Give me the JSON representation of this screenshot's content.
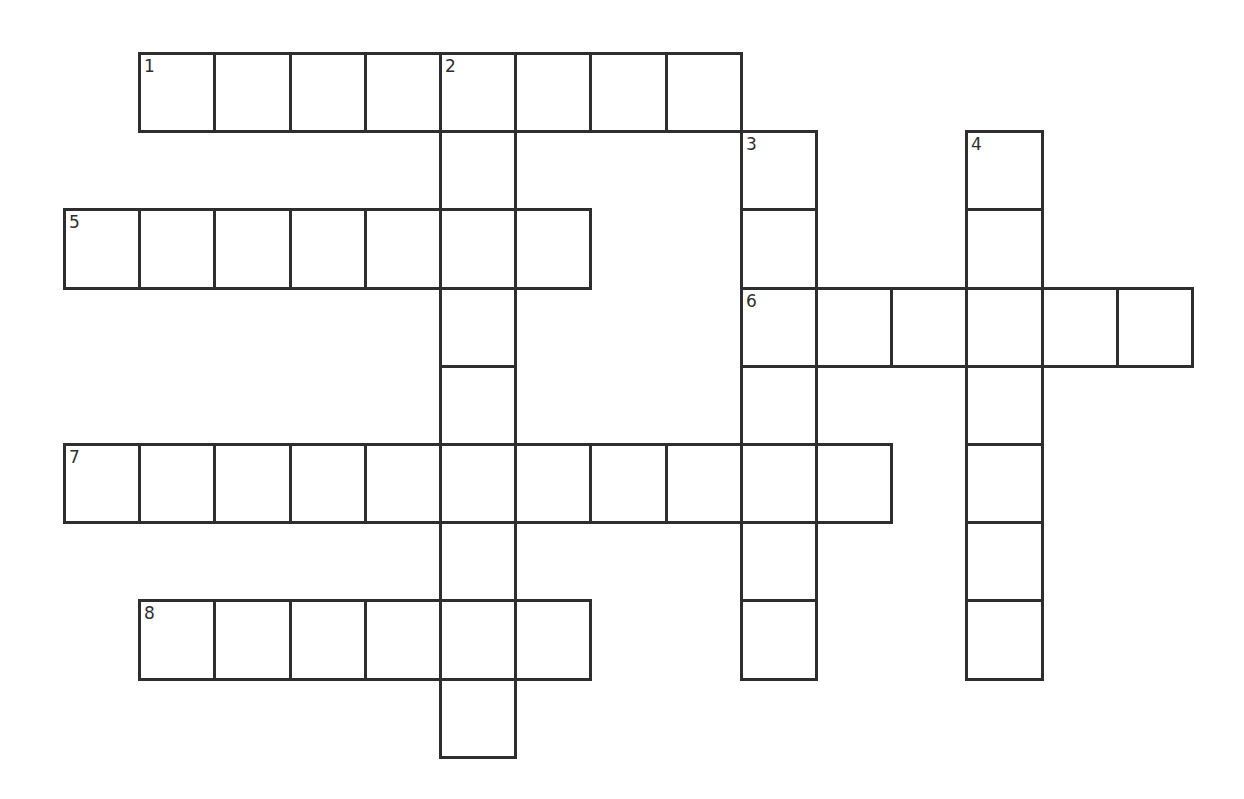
{
  "puzzle": {
    "type": "crossword",
    "grid_origin": {
      "x": 63,
      "y": 52
    },
    "cell_width": 75.2,
    "cell_height": 78.2,
    "line_color": "#2e2e2e",
    "entries": [
      {
        "number": "1",
        "direction": "across",
        "row": 0,
        "col": 1,
        "length": 8
      },
      {
        "number": "2",
        "direction": "down",
        "row": 0,
        "col": 5,
        "length": 9
      },
      {
        "number": "3",
        "direction": "down",
        "row": 1,
        "col": 9,
        "length": 7
      },
      {
        "number": "4",
        "direction": "down",
        "row": 1,
        "col": 12,
        "length": 7
      },
      {
        "number": "5",
        "direction": "across",
        "row": 2,
        "col": 0,
        "length": 7
      },
      {
        "number": "6",
        "direction": "across",
        "row": 3,
        "col": 9,
        "length": 6
      },
      {
        "number": "7",
        "direction": "across",
        "row": 5,
        "col": 0,
        "length": 11
      },
      {
        "number": "8",
        "direction": "across",
        "row": 7,
        "col": 1,
        "length": 6
      }
    ]
  }
}
